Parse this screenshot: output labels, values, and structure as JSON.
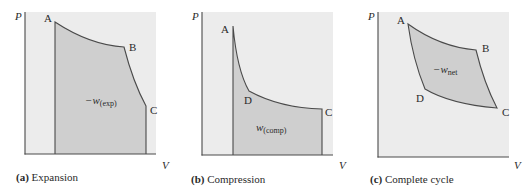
{
  "colors": {
    "plot_background": "#ececec",
    "shaded_region": "#cfcfcf",
    "line": "#4a4a4a",
    "text": "#2a2a2a"
  },
  "panels": [
    {
      "id": "a",
      "caption_letter": "(a)",
      "caption_text": " Expansion",
      "y_axis_label": "P",
      "x_axis_label": "V",
      "points": {
        "A": "A",
        "B": "B",
        "C": "C"
      },
      "work_label": {
        "prefix": "−w",
        "subscript": "(exp)"
      }
    },
    {
      "id": "b",
      "caption_letter": "(b)",
      "caption_text": " Compression",
      "y_axis_label": "P",
      "x_axis_label": "V",
      "points": {
        "A": "A",
        "D": "D",
        "C": "C"
      },
      "work_label": {
        "prefix": "w",
        "subscript": "(comp)"
      }
    },
    {
      "id": "c",
      "caption_letter": "(c)",
      "caption_text": " Complete cycle",
      "y_axis_label": "P",
      "x_axis_label": "V",
      "points": {
        "A": "A",
        "B": "B",
        "C": "C",
        "D": "D"
      },
      "work_label": {
        "prefix": "−w",
        "subscript": "net"
      }
    }
  ]
}
